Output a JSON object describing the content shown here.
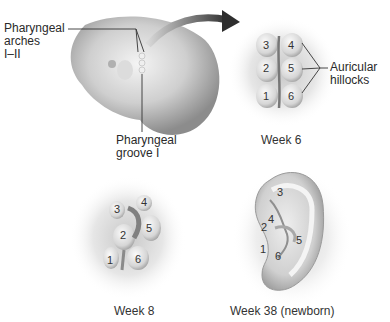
{
  "figure": {
    "panels": [
      {
        "id": "embryo",
        "labels": {
          "arches": [
            "Pharyngeal",
            "arches",
            "I–II"
          ],
          "groove": [
            "Pharyngeal",
            "groove I"
          ]
        }
      },
      {
        "id": "week6",
        "caption": "Week 6",
        "hillocks": [
          "1",
          "2",
          "3",
          "4",
          "5",
          "6"
        ],
        "callout": [
          "Auricular",
          "hillocks"
        ]
      },
      {
        "id": "week8",
        "caption": "Week 8",
        "hillocks": [
          "1",
          "2",
          "3",
          "4",
          "5",
          "6"
        ]
      },
      {
        "id": "week38",
        "caption": "Week 38 (newborn)",
        "hillocks": [
          "1",
          "2",
          "3",
          "4",
          "5",
          "6"
        ]
      }
    ],
    "colors": {
      "background": "#ffffff",
      "tissue_light": "#e8e8e8",
      "tissue_mid": "#bdbdbd",
      "tissue_dark": "#7a7a7a",
      "arrow": "#3a3a3a",
      "leader_line": "#333333"
    }
  }
}
